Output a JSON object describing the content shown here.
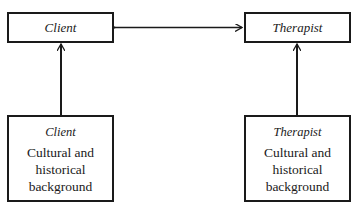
{
  "diagram": {
    "top_left": {
      "label": "Client"
    },
    "top_right": {
      "label": "Therapist"
    },
    "bottom_left": {
      "title": "Client",
      "lines": [
        "Cultural and",
        "historical",
        "background"
      ]
    },
    "bottom_right": {
      "title": "Therapist",
      "lines": [
        "Cultural and",
        "historical",
        "background"
      ]
    },
    "connections": [
      {
        "from": "top_left",
        "to": "top_right",
        "type": "bidirectional-arrow"
      },
      {
        "from": "bottom_left",
        "to": "top_left",
        "type": "arrow"
      },
      {
        "from": "bottom_right",
        "to": "top_right",
        "type": "arrow"
      }
    ],
    "colors": {
      "stroke": "#1a1a1a",
      "background": "#ffffff"
    }
  }
}
